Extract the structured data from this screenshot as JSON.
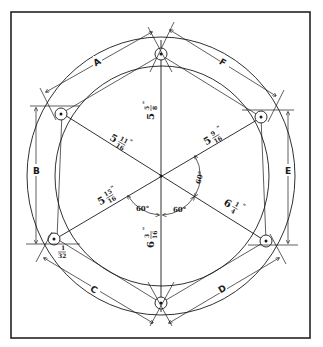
{
  "diagram": {
    "chord_labels": {
      "a": "A",
      "b": "B",
      "c": "C",
      "d": "D",
      "e": "E",
      "f": "F"
    },
    "dimensions": {
      "top_vertical": {
        "whole": "5",
        "num": "5",
        "den": "8",
        "unit": "\""
      },
      "upper_left_diagonal": {
        "whole": "5",
        "num": "11",
        "den": "16",
        "unit": "\""
      },
      "upper_right_diagonal": {
        "whole": "5",
        "num": "9",
        "den": "16",
        "unit": "\""
      },
      "lower_left_diagonal": {
        "whole": "5",
        "num": "15",
        "den": "16",
        "unit": "\""
      },
      "lower_right_diagonal": {
        "whole": "6",
        "num": "1",
        "den": "4",
        "unit": "\""
      },
      "bottom_vertical": {
        "whole": "6",
        "num": "3",
        "den": "16",
        "unit": "\""
      },
      "hole_offset": {
        "num": "1",
        "den": "32"
      }
    },
    "angles": {
      "right": "60°",
      "bottom_left": "60°",
      "bottom_right": "60°"
    },
    "colors": {
      "line": "#1a1a1a",
      "background": "#ffffff"
    }
  }
}
